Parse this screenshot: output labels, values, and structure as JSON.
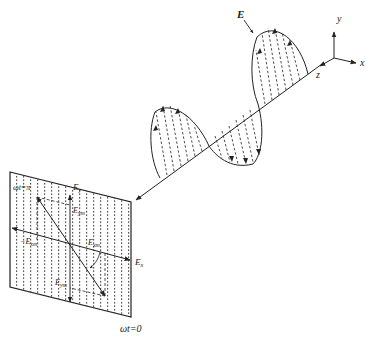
{
  "diagram": {
    "axes": {
      "x_label": "x",
      "y_label": "y",
      "z_label": "z"
    },
    "wave_label": "E",
    "plane": {
      "ex_label": "E",
      "ex_sub": "x",
      "ey_label": "E",
      "ey_sub": "y",
      "eym_label": "E",
      "eym_sub": "ym",
      "neg_exm_label": "−E",
      "neg_exm_sub": "xm",
      "exm_label": "E",
      "exm_sub": "xm",
      "neg_eym_label": "E",
      "neg_eym_sub": "ym",
      "phase_top_left": "ωt=π",
      "phase_bottom": "ωt=0"
    },
    "colors": {
      "line": "#222222",
      "background": "#ffffff",
      "dots": "#333333"
    }
  }
}
